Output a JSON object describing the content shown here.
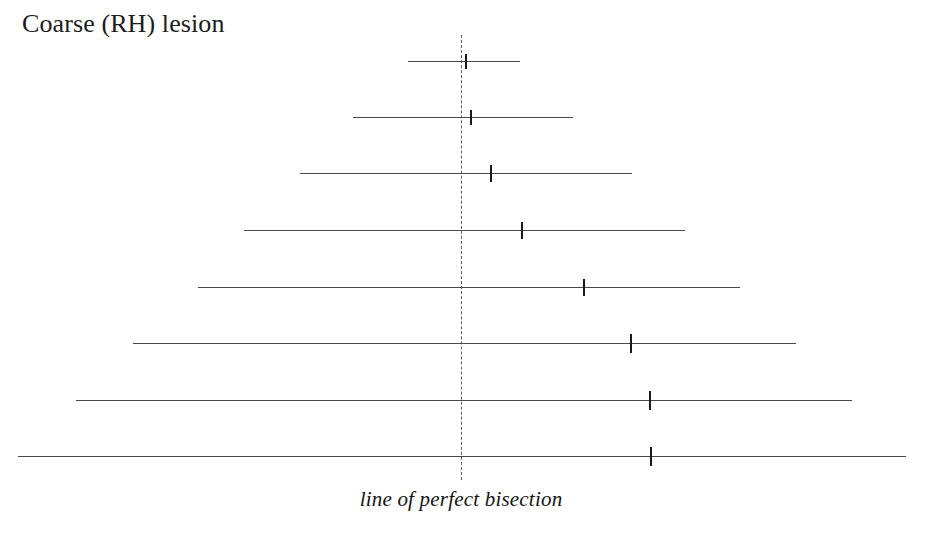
{
  "figure": {
    "title": "Coarse (RH) lesion",
    "reference_caption": "line of perfect bisection",
    "background_color": "#ffffff",
    "line_color": "#4a4a4a",
    "mark_color": "#191919",
    "reference_color": "#5d5d5d"
  },
  "chart_data": {
    "type": "line",
    "title": "Coarse (RH) lesion",
    "subtitle": "",
    "xlabel": "",
    "ylabel": "",
    "annotations": [
      {
        "text": "line of perfect bisection",
        "x": 461,
        "y": 504,
        "style": "italic",
        "points_to": "vertical dashed reference line"
      }
    ],
    "grid": false,
    "legend": null,
    "axis_ranges": {
      "x": [
        0,
        928
      ],
      "y": [
        0,
        550
      ]
    },
    "reference_line": {
      "orientation": "vertical",
      "x": 461,
      "y_top": 35,
      "y_bottom": 480,
      "style": "dashed",
      "label": "line of perfect bisection"
    },
    "series": [
      {
        "name": "stimulus lines",
        "row_label_key": "index",
        "rows": [
          {
            "index": 1,
            "y": 61,
            "x_left": 408,
            "x_right": 520,
            "length": 112,
            "true_center": 464.0,
            "mark_x": 465,
            "deviation_px": 1.0
          },
          {
            "index": 2,
            "y": 117,
            "x_left": 353,
            "x_right": 573,
            "length": 220,
            "true_center": 463.0,
            "mark_x": 470,
            "deviation_px": 7.0
          },
          {
            "index": 3,
            "y": 173,
            "x_left": 300,
            "x_right": 632,
            "length": 332,
            "true_center": 466.0,
            "mark_x": 490,
            "deviation_px": 24.0
          },
          {
            "index": 4,
            "y": 230,
            "x_left": 244,
            "x_right": 685,
            "length": 441,
            "true_center": 464.5,
            "mark_x": 521,
            "deviation_px": 56.5
          },
          {
            "index": 5,
            "y": 287,
            "x_left": 198,
            "x_right": 740,
            "length": 542,
            "true_center": 469.0,
            "mark_x": 583,
            "deviation_px": 114.0
          },
          {
            "index": 6,
            "y": 343,
            "x_left": 133,
            "x_right": 796,
            "length": 663,
            "true_center": 464.5,
            "mark_x": 630,
            "deviation_px": 165.5
          },
          {
            "index": 7,
            "y": 400,
            "x_left": 76,
            "x_right": 852,
            "length": 776,
            "true_center": 464.0,
            "mark_x": 649,
            "deviation_px": 185.0
          },
          {
            "index": 8,
            "y": 456,
            "x_left": 18,
            "x_right": 906,
            "length": 888,
            "true_center": 462.0,
            "mark_x": 650,
            "deviation_px": 188.0
          }
        ]
      }
    ]
  }
}
